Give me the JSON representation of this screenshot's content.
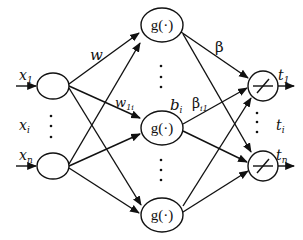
{
  "diagram": {
    "type": "neural-network",
    "colors": {
      "stroke": "#111111",
      "background": "#ffffff"
    },
    "input_layer": {
      "nodes": [
        {
          "label": "x",
          "sub": "1"
        },
        {
          "label": "x",
          "sub": "n"
        }
      ],
      "ellipsis_label": {
        "label": "x",
        "sub": "i"
      }
    },
    "hidden_layer": {
      "nodes": [
        {
          "label": "g(·)"
        },
        {
          "label": "g(·)"
        },
        {
          "label": "g(·)"
        }
      ]
    },
    "output_layer": {
      "nodes": [
        {
          "label": "t",
          "sub": "1"
        },
        {
          "label": "t",
          "sub": "n"
        }
      ],
      "ellipsis_label": {
        "label": "t",
        "sub": "i"
      },
      "node_symbol": "linear-activation-slash"
    },
    "edge_labels": {
      "w": "w",
      "w1i": {
        "label": "w",
        "sub": "1i"
      },
      "bi": {
        "label": "b",
        "sub": "i"
      },
      "beta": "β",
      "betai1": {
        "label": "β",
        "sub": "i1"
      }
    }
  }
}
